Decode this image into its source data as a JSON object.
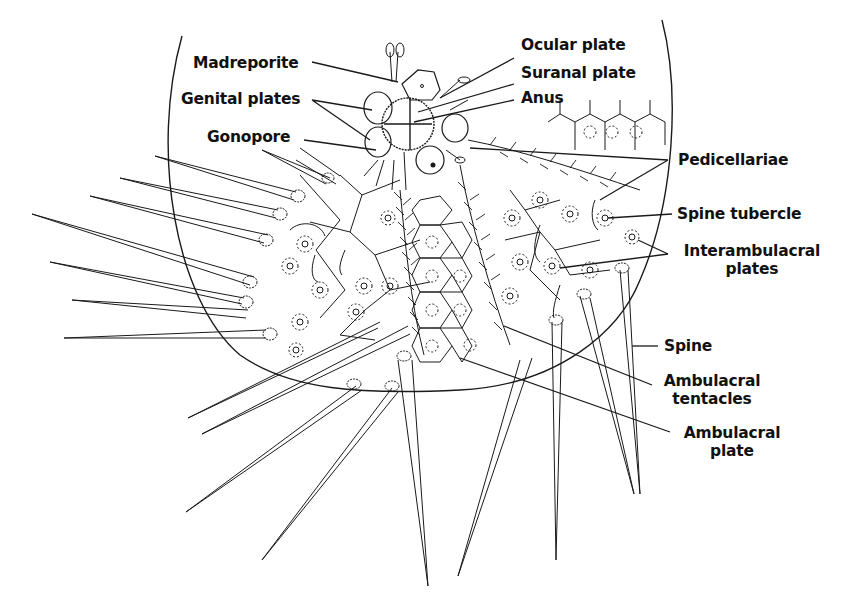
{
  "figure": {
    "colors": {
      "ink": "#1a1a1a",
      "background": "#ffffff"
    }
  },
  "labels": {
    "madreporite": "Madreporite",
    "genital_plates": "Genital plates",
    "gonopore": "Gonopore",
    "ocular_plate": "Ocular plate",
    "suranal_plate": "Suranal plate",
    "anus": "Anus",
    "pedicellariae": "Pedicellariae",
    "spine_tubercle": "Spine tubercle",
    "interambulacral_plates_1": "Interambulacral",
    "interambulacral_plates_2": "plates",
    "spine": "Spine",
    "ambulacral_tentacles_1": "Ambulacral",
    "ambulacral_tentacles_2": "tentacles",
    "ambulacral_plate_1": "Ambulacral",
    "ambulacral_plate_2": "plate"
  }
}
